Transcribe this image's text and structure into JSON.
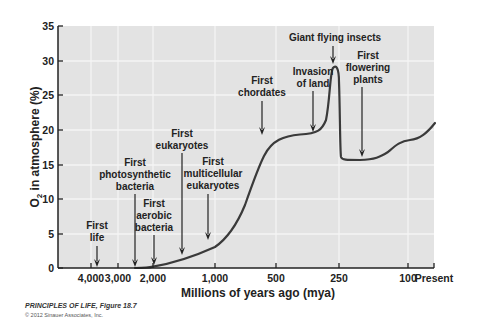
{
  "chart_data": {
    "type": "line",
    "title": "",
    "xlabel": "Millions of years ago (mya)",
    "ylabel": "O2 in atmosphere (%)",
    "ylim": [
      0,
      35
    ],
    "yticks": [
      0,
      5,
      10,
      15,
      20,
      25,
      30,
      35
    ],
    "xtick_labels": [
      "4,000",
      "3,000",
      "2,000",
      "1,000",
      "500",
      "250",
      "100",
      "Present"
    ],
    "grid": true,
    "series": [
      {
        "name": "Atmospheric O2",
        "x_mya": [
          2400,
          2000,
          1500,
          1000,
          800,
          700,
          600,
          500,
          400,
          350,
          300,
          280,
          270,
          255,
          250,
          200,
          150,
          110,
          90,
          0
        ],
        "values": [
          0,
          0.2,
          1,
          3,
          8,
          14,
          18.5,
          19.3,
          19.5,
          20.5,
          25,
          29,
          28,
          20,
          15.5,
          15.5,
          16,
          18.3,
          18.5,
          21
        ]
      }
    ],
    "annotations": [
      {
        "lines": [
          "First",
          "life"
        ],
        "mya": 3800
      },
      {
        "lines": [
          "First",
          "photosynthetic",
          "bacteria"
        ],
        "mya": 2400
      },
      {
        "lines": [
          "First",
          "aerobic",
          "bacteria"
        ],
        "mya": 2000
      },
      {
        "lines": [
          "First",
          "eukaryotes"
        ],
        "mya": 1500
      },
      {
        "lines": [
          "First",
          "multicellular",
          "eukaryotes"
        ],
        "mya": 1000
      },
      {
        "lines": [
          "First",
          "chordates"
        ],
        "mya": 600
      },
      {
        "lines": [
          "Invasion",
          "of land"
        ],
        "mya": 350
      },
      {
        "lines": [
          "Giant flying insects"
        ],
        "mya": 280
      },
      {
        "lines": [
          "First",
          "flowering",
          "plants"
        ],
        "mya": 150
      }
    ]
  },
  "y_axis": {
    "label_prefix": "O",
    "label_sub": "2",
    "label_rest": " in atmosphere (%)",
    "ticks": [
      {
        "label": "35",
        "y": 26
      },
      {
        "label": "30",
        "y": 61
      },
      {
        "label": "25",
        "y": 95
      },
      {
        "label": "20",
        "y": 130
      },
      {
        "label": "15",
        "y": 165
      },
      {
        "label": "10",
        "y": 199
      },
      {
        "label": "5",
        "y": 234
      },
      {
        "label": "0",
        "y": 268
      }
    ]
  },
  "x_axis": {
    "label": "Millions of years ago (mya)",
    "ticks": [
      {
        "label": "4,000",
        "x": 91
      },
      {
        "label": "3,000",
        "x": 118
      },
      {
        "label": "2,000",
        "x": 153
      },
      {
        "label": "1,000",
        "x": 215
      },
      {
        "label": "500",
        "x": 276
      },
      {
        "label": "250",
        "x": 339
      },
      {
        "label": "100",
        "x": 408
      },
      {
        "label": "Present",
        "x": 434
      }
    ]
  },
  "plot": {
    "left": 58,
    "top": 26,
    "right": 434,
    "bottom": 268,
    "bg_color": "#e3e3e3",
    "grid_color": "#f5f5f5",
    "curve_color": "#3a3a3a",
    "curve_path": "M 135 268 C 145 268, 150 267.5, 153 266.6 C 175 263, 195 256, 215 247 C 228 238, 238 222, 245 205 C 252 185, 258 168, 264 156 C 272 140, 284 136, 300 134.5 C 318 133.5, 322 130, 326 120 C 330 100, 330 72, 333 68 C 336 64, 339 68, 339 82 C 340 110, 340 150, 341 157 C 342 160, 346 160, 360 160 C 375 159.5, 380 157, 388 152 C 395 146, 400 141, 410 140 C 420 139, 427 133, 435 123"
  },
  "annotations": [
    {
      "lines": [
        "First",
        "life"
      ],
      "text_x": 97,
      "text_y": [
        229,
        241
      ],
      "arrow_x": 97,
      "arrow_y1": 246,
      "arrow_y2": 267
    },
    {
      "lines": [
        "First",
        "photosynthetic",
        "bacteria"
      ],
      "text_x": 135,
      "text_y": [
        166,
        178,
        190
      ],
      "arrow_x": 135,
      "arrow_y1": 194,
      "arrow_y2": 267
    },
    {
      "lines": [
        "First",
        "aerobic",
        "bacteria"
      ],
      "text_x": 154,
      "text_y": [
        207,
        219,
        231
      ],
      "arrow_x": 154,
      "arrow_y1": 235,
      "arrow_y2": 265
    },
    {
      "lines": [
        "First",
        "eukaryotes"
      ],
      "text_x": 182,
      "text_y": [
        137,
        149
      ],
      "arrow_x": 182,
      "arrow_y1": 153,
      "arrow_y2": 255
    },
    {
      "lines": [
        "First",
        "multicellular",
        "eukaryotes"
      ],
      "text_x": 213,
      "text_y": [
        165,
        177,
        189
      ],
      "arrow_x": 208,
      "arrow_y1": 194,
      "arrow_y2": 240
    },
    {
      "lines": [
        "First",
        "chordates"
      ],
      "text_x": 262,
      "text_y": [
        84,
        96
      ],
      "arrow_x": 262,
      "arrow_y1": 101,
      "arrow_y2": 135
    },
    {
      "lines": [
        "Invasion",
        "of land"
      ],
      "text_x": 313,
      "text_y": [
        75,
        87
      ],
      "arrow_x": 313,
      "arrow_y1": 91,
      "arrow_y2": 132
    },
    {
      "lines": [
        "Giant flying insects"
      ],
      "text_x": 335,
      "text_y": [
        41
      ],
      "arrow_x": 333,
      "arrow_y1": 46,
      "arrow_y2": 64
    },
    {
      "lines": [
        "First",
        "flowering",
        "plants"
      ],
      "text_x": 368,
      "text_y": [
        59,
        71,
        83
      ],
      "arrow_x": 362,
      "arrow_y1": 87,
      "arrow_y2": 157
    }
  ],
  "credit": {
    "title": "PRINCIPLES OF LIFE, Figure 18.7",
    "copyright": "© 2012 Sinauer Associates, Inc."
  }
}
